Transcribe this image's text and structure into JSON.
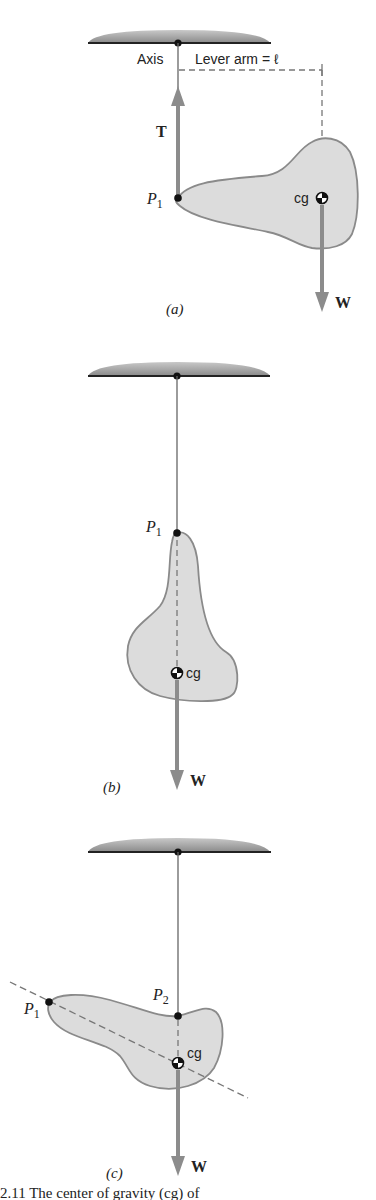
{
  "figure": {
    "panels": [
      {
        "id": "a",
        "label": "(a)",
        "axis_label": "Axis",
        "lever_arm_label": "Lever arm = ℓ",
        "tension_label": "T⃗",
        "weight_label": "W⃗",
        "pivot_point_label": "P",
        "pivot_point_sub": "1",
        "cg_label": "cg"
      },
      {
        "id": "b",
        "label": "(b)",
        "weight_label": "W⃗",
        "pivot_point_label": "P",
        "pivot_point_sub": "1",
        "cg_label": "cg"
      },
      {
        "id": "c",
        "label": "(c)",
        "weight_label": "W⃗",
        "point1_label": "P",
        "point1_sub": "1",
        "point2_label": "P",
        "point2_sub": "2",
        "cg_label": "cg"
      }
    ],
    "caption_partial": "   2.11  The center of gravity (cg) of"
  },
  "colors": {
    "body_fill": "#dcdcdc",
    "body_outline": "#8a8a8a",
    "vector": "#8c8c8c",
    "ceiling": "#8f8f8f",
    "line": "#555555",
    "text": "#222222"
  }
}
